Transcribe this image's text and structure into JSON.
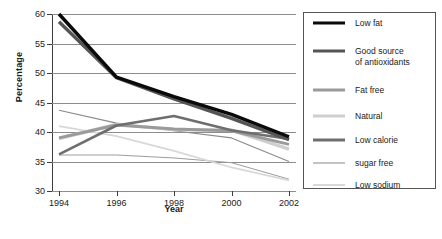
{
  "chart_data": {
    "type": "line",
    "title": "",
    "xlabel": "Year",
    "ylabel": "Percentage",
    "categories": [
      1994,
      1996,
      1998,
      2000,
      2002
    ],
    "x_tick_labels": [
      "1994",
      "1996",
      "1998",
      "2000",
      "2002"
    ],
    "y_tick_labels": [
      "30",
      "35",
      "40",
      "45",
      "50",
      "55",
      "60"
    ],
    "y_ticks": [
      30,
      35,
      40,
      45,
      50,
      55,
      60
    ],
    "ylim": [
      30,
      60
    ],
    "grid": "horizontal",
    "legend_position": "right-outside",
    "series": [
      {
        "name": "Low fat",
        "values": [
          60.0,
          49.3,
          46.0,
          43.0,
          39.2
        ],
        "color": "#0a0a0a",
        "width": 3.4
      },
      {
        "name": "Good source of antioxidants",
        "values": [
          58.7,
          49.2,
          45.6,
          42.3,
          38.7
        ],
        "color": "#555555",
        "width": 3.4
      },
      {
        "name": "Fat free",
        "values": [
          39.0,
          41.2,
          40.5,
          40.2,
          37.9
        ],
        "color": "#9a9a9a",
        "width": 3.0
      },
      {
        "name": "Natural",
        "values": [
          38.9,
          41.3,
          40.4,
          40.3,
          37.1
        ],
        "color": "#cfcfcf",
        "width": 3.4
      },
      {
        "name": "Low calorie",
        "values": [
          36.2,
          41.1,
          42.7,
          40.3,
          38.8
        ],
        "color": "#6e6e6e",
        "width": 2.6
      },
      {
        "name": "sugar free",
        "values": [
          43.7,
          41.5,
          40.2,
          39.0,
          35.0
        ],
        "color": "#8a8a8a",
        "width": 1.1
      },
      {
        "name": "Low sodium",
        "values": [
          41.0,
          39.3,
          36.8,
          34.0,
          31.8
        ],
        "color": "#d8d8d8",
        "width": 1.6
      }
    ],
    "extra_lines": [
      {
        "name": "low-calorie-flat-baseline",
        "values": [
          36.1,
          36.1,
          35.6,
          34.8,
          32.0
        ],
        "color": "#9d9d9d",
        "width": 1.0
      }
    ]
  },
  "legend": {
    "items": [
      {
        "label": "Low fat"
      },
      {
        "label": "Good source\nof antioxidants"
      },
      {
        "label": "Fat free"
      },
      {
        "label": "Natural"
      },
      {
        "label": "Low calorie"
      },
      {
        "label": "sugar free"
      },
      {
        "label": "Low sodium"
      }
    ]
  }
}
